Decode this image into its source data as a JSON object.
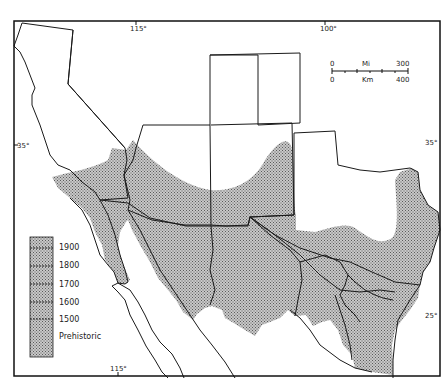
{
  "map": {
    "title": "",
    "frame": {
      "stroke": "#111111"
    },
    "fill_pattern": {
      "base": "#bfbfbf",
      "dot": "#6a6a6a"
    },
    "graticule_labels": {
      "top_115": "115°",
      "top_100": "100°",
      "left_35": "35°",
      "right_35": "35°",
      "right_25": "25°",
      "bottom_115": "115°"
    },
    "scale_bar": {
      "mi_zero": "0",
      "mi_unit": "Mi",
      "mi_max": "300",
      "km_zero": "0",
      "km_unit": "Km",
      "km_max": "400"
    },
    "legend": {
      "items": [
        {
          "label": "1900"
        },
        {
          "label": "1800"
        },
        {
          "label": "1700"
        },
        {
          "label": "1600"
        },
        {
          "label": "1500"
        },
        {
          "label": "Prehistoric"
        }
      ]
    }
  }
}
